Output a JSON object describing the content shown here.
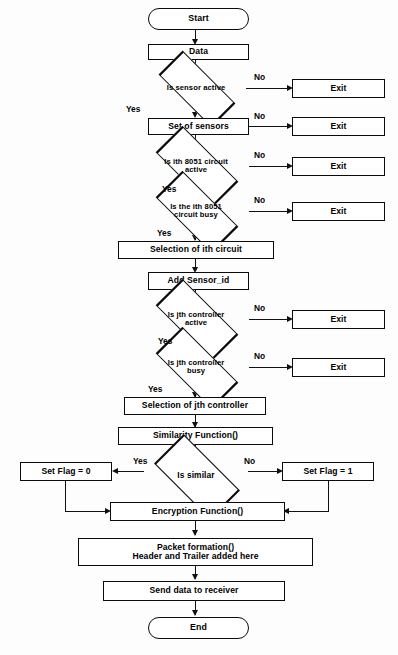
{
  "figure": {
    "type": "flowchart",
    "caption": ""
  },
  "nodes": {
    "start": {
      "label": "Start",
      "shape": "terminator"
    },
    "data": {
      "label": "Data",
      "shape": "process"
    },
    "is_sensor_active": {
      "label_line1": "Is sensor active",
      "shape": "decision"
    },
    "exit_1": {
      "label": "Exit",
      "shape": "process"
    },
    "set_of_sensors": {
      "label": "Set of sensors",
      "shape": "process"
    },
    "exit_2": {
      "label": "Exit",
      "shape": "process"
    },
    "is_ith_8051_active": {
      "label_line1": "Is ith 8051 circuit",
      "label_line2": "active",
      "shape": "decision"
    },
    "exit_3": {
      "label": "Exit",
      "shape": "process"
    },
    "is_ith_8051_busy": {
      "label_line1": "Is the ith 8051",
      "label_line2": "circuit busy",
      "shape": "decision"
    },
    "exit_4": {
      "label": "Exit",
      "shape": "process"
    },
    "selection_ith_circuit": {
      "label": "Selection of ith circuit",
      "shape": "process"
    },
    "add_sensor_id": {
      "label": "Add Sensor_id",
      "shape": "process"
    },
    "is_jth_controller_active": {
      "label_line1": "Is jth controller",
      "label_line2": "active",
      "shape": "decision"
    },
    "exit_5": {
      "label": "Exit",
      "shape": "process"
    },
    "is_jth_controller_busy": {
      "label_line1": "Is jth controller",
      "label_line2": "busy",
      "shape": "decision"
    },
    "exit_6": {
      "label": "Exit",
      "shape": "process"
    },
    "selection_jth_controller": {
      "label": "Selection of jth controller",
      "shape": "process"
    },
    "similarity_function": {
      "label": "Similarity Function()",
      "shape": "process"
    },
    "is_similar": {
      "label_line1": "Is similar",
      "shape": "decision"
    },
    "set_flag_0": {
      "label": "Set Flag = 0",
      "shape": "process"
    },
    "set_flag_1": {
      "label": "Set Flag = 1",
      "shape": "process"
    },
    "encryption_function": {
      "label": "Encryption Function()",
      "shape": "process"
    },
    "packet_formation": {
      "label_line1": "Packet formation()",
      "label_line2": "Header and Trailer added here",
      "shape": "process"
    },
    "send_data": {
      "label": "Send data to receiver",
      "shape": "process"
    },
    "end": {
      "label": "End",
      "shape": "terminator"
    }
  },
  "edge_labels": {
    "no_1": "No",
    "yes_1": "Yes",
    "no_2": "No",
    "no_3": "No",
    "yes_3": "Yes",
    "no_4": "No",
    "yes_4": "Yes",
    "no_5": "No",
    "yes_5": "Yes",
    "no_6": "No",
    "yes_6": "Yes",
    "yes_similar": "Yes",
    "no_similar": "No"
  },
  "colors": {
    "stroke": "#0b0b0b",
    "fill": "#ffffff",
    "background": "#fdfdfd",
    "text": "#000000"
  }
}
